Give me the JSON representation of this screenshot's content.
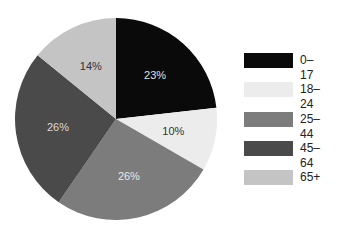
{
  "chart_data": {
    "type": "pie",
    "title": "",
    "categories": [
      "0–17",
      "18–24",
      "25–44",
      "45–64",
      "65+"
    ],
    "values": [
      23,
      10,
      26,
      26,
      14
    ],
    "labels": [
      "23%",
      "10%",
      "26%",
      "26%",
      "14%"
    ],
    "colors": [
      "#0a0a0a",
      "#ececec",
      "#7c7c7c",
      "#4a4a4a",
      "#c4c4c4"
    ],
    "label_colors": [
      "#e0e0e0",
      "#333333",
      "#e8e8e8",
      "#d8d8d8",
      "#333333"
    ],
    "start_angle_deg": 0,
    "direction": "clockwise",
    "legend_position": "right"
  },
  "legend": {
    "items": [
      {
        "label": "0–17",
        "color": "#0a0a0a"
      },
      {
        "label": "18–24",
        "color": "#ececec"
      },
      {
        "label": "25–44",
        "color": "#7c7c7c"
      },
      {
        "label": "45–64",
        "color": "#4a4a4a"
      },
      {
        "label": "65+",
        "color": "#c4c4c4"
      }
    ]
  }
}
